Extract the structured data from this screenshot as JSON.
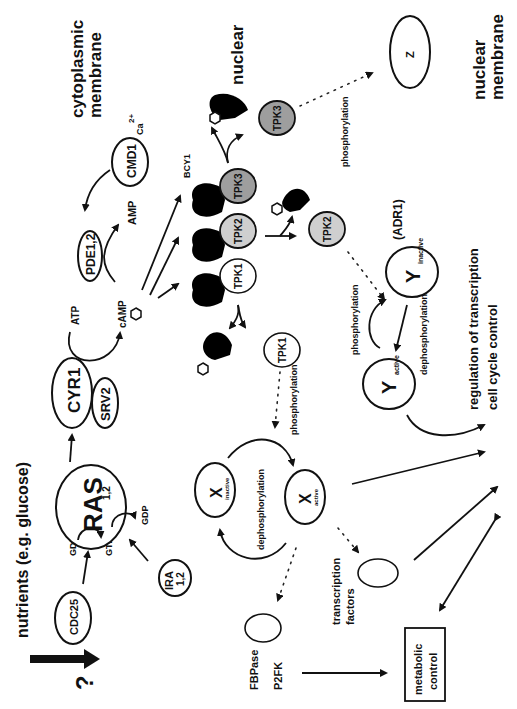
{
  "diagram": {
    "orientation": "rotated 90 degrees counter-clockwise",
    "labels": {
      "cytoplasmic_membrane": [
        "cytoplasmic",
        "membrane"
      ],
      "nuclear_membrane": [
        "nuclear",
        "membrane"
      ],
      "nutrients": "nutrients (e.g. glucose)",
      "question": "?",
      "cdc25": "CDC25",
      "ras": "RAS",
      "ras_sub": "1,2",
      "ira": "IRA",
      "ira_sub": "1,2",
      "gdp_left": "GDP",
      "gtp": "GTP",
      "gdp_right": "GDP",
      "cyr1": "CYR1",
      "srv2": "SRV2",
      "atp": "ATP",
      "camp": "cAMP",
      "pde": "PDE1,2",
      "amp": "AMP",
      "cmd1": "CMD1",
      "ca": "Ca",
      "ca_sup": "2+",
      "bcy1": "BCY1",
      "tpk1": "TPK1",
      "tpk2": "TPK2",
      "tpk3": "TPK3",
      "tpk1_free": "TPK1",
      "tpk2_free": "TPK2",
      "tpk3_free": "TPK3",
      "z": "Z",
      "phos_z": "phosphorylation",
      "adr1": "(ADR1)",
      "y_inactive": "Y",
      "y_inactive_sub": "inactive",
      "y_active": "Y",
      "y_active_sub": "active",
      "phos_y_dotted": "phosphorylation",
      "dephos_y": "dephosphorylation",
      "phos_x_dotted": "phosphorylation",
      "x_inactive": "X",
      "x_inactive_sub": "inactive",
      "x_active": "X",
      "x_active_sub": "active",
      "dephos_x": "dephosphorylation",
      "regulation": [
        "regulation of transcription",
        "cell cycle control"
      ],
      "transcription_factors": [
        "transcription",
        "factors"
      ],
      "fbpase": "FBPase",
      "p2fk": "P2FK",
      "metabolic_control": [
        "metabolic",
        "control"
      ]
    }
  }
}
